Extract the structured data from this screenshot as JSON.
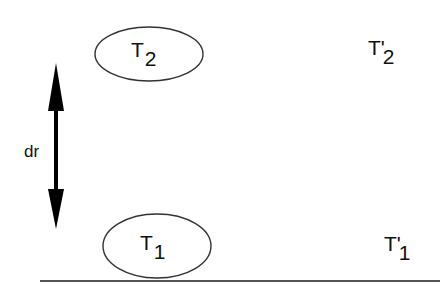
{
  "diagram": {
    "background": "#ffffff",
    "stroke_color": "#333333",
    "arrow_color": "#000000",
    "nodes": [
      {
        "id": "T2",
        "main": "T",
        "sub": "2",
        "shape": "ellipse"
      },
      {
        "id": "T1",
        "main": "T",
        "sub": "1",
        "shape": "ellipse"
      },
      {
        "id": "T2prime",
        "main": "T'",
        "sub": "2",
        "shape": "none"
      },
      {
        "id": "T1prime",
        "main": "T'",
        "sub": "1",
        "shape": "none"
      }
    ],
    "arrow": {
      "label": "dr",
      "direction": "bidirectional-vertical"
    },
    "baseline": {
      "description": "horizontal ground line"
    }
  }
}
